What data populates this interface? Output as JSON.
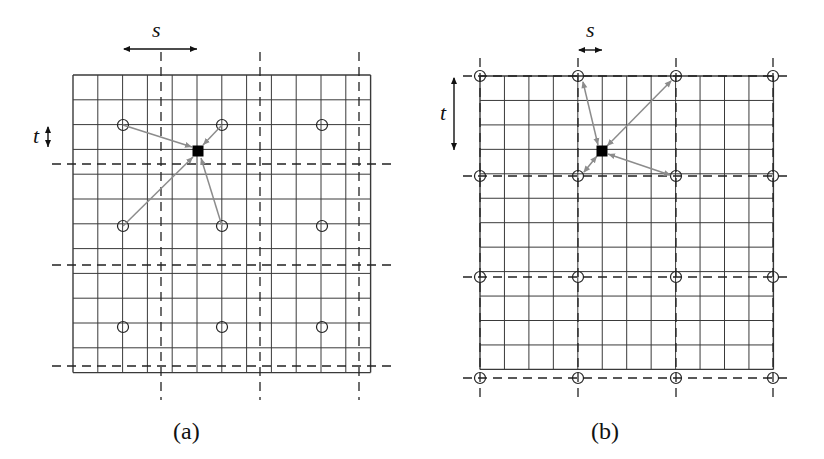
{
  "figure": {
    "panels": [
      {
        "id": "a",
        "caption": "(a)",
        "caption_pos": [
          188,
          436
        ],
        "grid": {
          "x0": 73,
          "y0": 75,
          "cols": 12,
          "rows": 12,
          "cell": 24.8
        },
        "dashed_v": [
          161,
          260,
          359
        ],
        "dashed_h": [
          164,
          265,
          366
        ],
        "dashed_v_range": [
          52,
          400
        ],
        "dashed_h_range": [
          52,
          394
        ],
        "circles": [
          [
            123,
            125
          ],
          [
            222,
            125
          ],
          [
            322,
            125
          ],
          [
            123,
            226
          ],
          [
            222,
            226
          ],
          [
            322,
            226
          ],
          [
            123,
            327
          ],
          [
            222,
            327
          ],
          [
            322,
            327
          ]
        ],
        "target": [
          198,
          151
        ],
        "arrows": [
          {
            "from": [
              123,
              125
            ],
            "to": [
              192,
              147
            ],
            "double": false
          },
          {
            "from": [
              222,
              125
            ],
            "to": [
              203,
              145
            ],
            "double": false
          },
          {
            "from": [
              123,
              226
            ],
            "to": [
              193,
              157
            ],
            "double": false
          },
          {
            "from": [
              222,
              226
            ],
            "to": [
              201,
              158
            ],
            "double": false
          }
        ],
        "s_label": "s",
        "s_arrow": {
          "x1": 124,
          "x2": 197,
          "y": 49
        },
        "s_label_pos": [
          155,
          40
        ],
        "t_label": "t",
        "t_arrow": {
          "x": 48,
          "y1": 127,
          "y2": 147
        },
        "t_label_pos": [
          36,
          143
        ]
      },
      {
        "id": "b",
        "caption": "(b)",
        "caption_pos": [
          607,
          436
        ],
        "grid": {
          "x0": 480,
          "y0": 76,
          "cols": 12,
          "rows": 12,
          "cell": 24.45
        },
        "dashed_v": [
          480,
          578,
          676,
          773
        ],
        "dashed_h": [
          76,
          176,
          277,
          378
        ],
        "dashed_v_range": [
          58,
          398
        ],
        "dashed_h_range": [
          463,
          792
        ],
        "circles": [
          [
            480,
            76
          ],
          [
            578,
            76
          ],
          [
            676,
            76
          ],
          [
            773,
            76
          ],
          [
            480,
            176
          ],
          [
            578,
            176
          ],
          [
            676,
            176
          ],
          [
            773,
            176
          ],
          [
            480,
            277
          ],
          [
            578,
            277
          ],
          [
            676,
            277
          ],
          [
            773,
            277
          ],
          [
            480,
            378
          ],
          [
            578,
            378
          ],
          [
            676,
            378
          ],
          [
            773,
            378
          ]
        ],
        "target": [
          602,
          151
        ],
        "arrows": [
          {
            "from": [
              583,
              82
            ],
            "to": [
              598,
              145
            ],
            "double": true
          },
          {
            "from": [
              671,
              81
            ],
            "to": [
              607,
              146
            ],
            "double": true
          },
          {
            "from": [
              584,
              172
            ],
            "to": [
              597,
              156
            ],
            "double": true
          },
          {
            "from": [
              670,
              175
            ],
            "to": [
              608,
              154
            ],
            "double": true
          }
        ],
        "s_label": "s",
        "s_arrow": {
          "x1": 579,
          "x2": 602,
          "y": 50
        },
        "s_label_pos": [
          590,
          40
        ],
        "t_label": "t",
        "t_arrow": {
          "x": 454,
          "y1": 78,
          "y2": 150
        },
        "t_label_pos": [
          443,
          120
        ]
      }
    ],
    "colors": {
      "grid": "#3a3a3a",
      "dashed": "#222222",
      "arrow": "#8c8c8c",
      "target": "#000000",
      "circle": "#222222"
    }
  }
}
